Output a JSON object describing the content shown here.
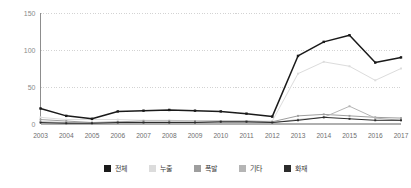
{
  "chart_data": {
    "type": "line",
    "title": "",
    "xlabel": "",
    "ylabel": "",
    "ylim": [
      0,
      150
    ],
    "yticks": [
      0,
      50,
      100,
      150
    ],
    "grid": true,
    "legend_position": "bottom",
    "categories": [
      "2003",
      "2004",
      "2005",
      "2006",
      "2007",
      "2008",
      "2009",
      "2010",
      "2011",
      "2012",
      "2013",
      "2014",
      "2015",
      "2016",
      "2017"
    ],
    "series": [
      {
        "name": "전체",
        "color": "#1a1a1a",
        "marker": "square",
        "values": [
          21,
          11,
          7,
          17,
          18,
          19,
          18,
          17,
          14,
          10,
          92,
          111,
          120,
          83,
          90
        ]
      },
      {
        "name": "누출",
        "color": "#dcdcdc",
        "marker": "square",
        "values": [
          9,
          6,
          6,
          6,
          5,
          5,
          4,
          4,
          4,
          4,
          68,
          84,
          78,
          59,
          75
        ]
      },
      {
        "name": "폭발",
        "color": "#9e9e9e",
        "marker": "square",
        "values": [
          6,
          4,
          2,
          3,
          4,
          4,
          4,
          4,
          4,
          3,
          11,
          13,
          11,
          9,
          8
        ]
      },
      {
        "name": "기타",
        "color": "#b5b5b5",
        "marker": "square",
        "values": [
          3,
          2,
          1,
          2,
          2,
          2,
          2,
          2,
          2,
          2,
          6,
          9,
          24,
          8,
          5
        ]
      },
      {
        "name": "화재",
        "color": "#2b2b2b",
        "marker": "square",
        "values": [
          2,
          1,
          1,
          2,
          2,
          2,
          2,
          3,
          3,
          2,
          5,
          9,
          7,
          5,
          5
        ]
      }
    ]
  },
  "legend": {
    "items": [
      {
        "label": "전체",
        "color": "#1a1a1a"
      },
      {
        "label": "누출",
        "color": "#dcdcdc"
      },
      {
        "label": "폭발",
        "color": "#9e9e9e"
      },
      {
        "label": "기타",
        "color": "#b5b5b5"
      },
      {
        "label": "화재",
        "color": "#2b2b2b"
      }
    ]
  }
}
